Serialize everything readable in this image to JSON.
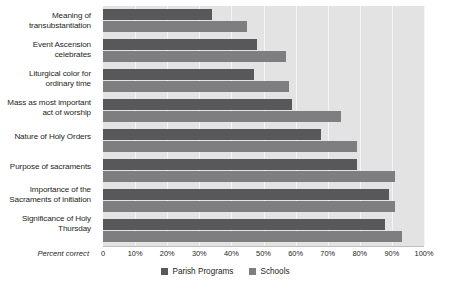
{
  "chart_data": {
    "type": "bar",
    "orientation": "horizontal",
    "title": "",
    "xlabel": "Percent correct",
    "ylabel": "",
    "xlim": [
      0,
      100
    ],
    "xticks": [
      "0",
      "10%",
      "20%",
      "30%",
      "40%",
      "50%",
      "60%",
      "70%",
      "80%",
      "90%",
      "100%"
    ],
    "xtick_values": [
      0,
      10,
      20,
      30,
      40,
      50,
      60,
      70,
      80,
      90,
      100
    ],
    "grid": true,
    "legend_position": "bottom-center",
    "categories": [
      "Meaning of transubstantiation",
      "Event Ascension celebrates",
      "Liturgical color for ordinary time",
      "Mass as most important act of worship",
      "Nature of Holy Orders",
      "Purpose of sacraments",
      "Importance of the Sacraments of initiation",
      "Significance of Holy Thursday"
    ],
    "series": [
      {
        "name": "Parish Programs",
        "color": "#58585a",
        "values": [
          34,
          48,
          47,
          59,
          68,
          79,
          89,
          88
        ]
      },
      {
        "name": "Schools",
        "color": "#7e7e80",
        "values": [
          45,
          57,
          58,
          74,
          79,
          91,
          91,
          93
        ]
      }
    ],
    "plot_background": "#e3e3e3",
    "gridline_color": "#f5f5f5"
  },
  "axis": {
    "title": "Percent correct"
  },
  "labels": {
    "row0_line0": "Meaning of",
    "row0_line1": "transubstantiation",
    "row1_line0": "Event Ascension",
    "row1_line1": "celebrates",
    "row2_line0": "Liturgical color for",
    "row2_line1": "ordinary time",
    "row3_line0": "Mass as most important",
    "row3_line1": "act of worship",
    "row4_line0": "Nature of Holy Orders",
    "row4_line1": "",
    "row5_line0": "Purpose of sacraments",
    "row5_line1": "",
    "row6_line0": "Importance of the",
    "row6_line1": "Sacraments of initiation",
    "row7_line0": "Significance of Holy",
    "row7_line1": "Thursday"
  },
  "legend": {
    "items": [
      {
        "label": "Parish Programs",
        "color": "#58585a"
      },
      {
        "label": "Schools",
        "color": "#7e7e80"
      }
    ]
  },
  "ticks": {
    "t0": "0",
    "t1": "10%",
    "t2": "20%",
    "t3": "30%",
    "t4": "40%",
    "t5": "50%",
    "t6": "60%",
    "t7": "70%",
    "t8": "80%",
    "t9": "90%",
    "t10": "100%"
  }
}
